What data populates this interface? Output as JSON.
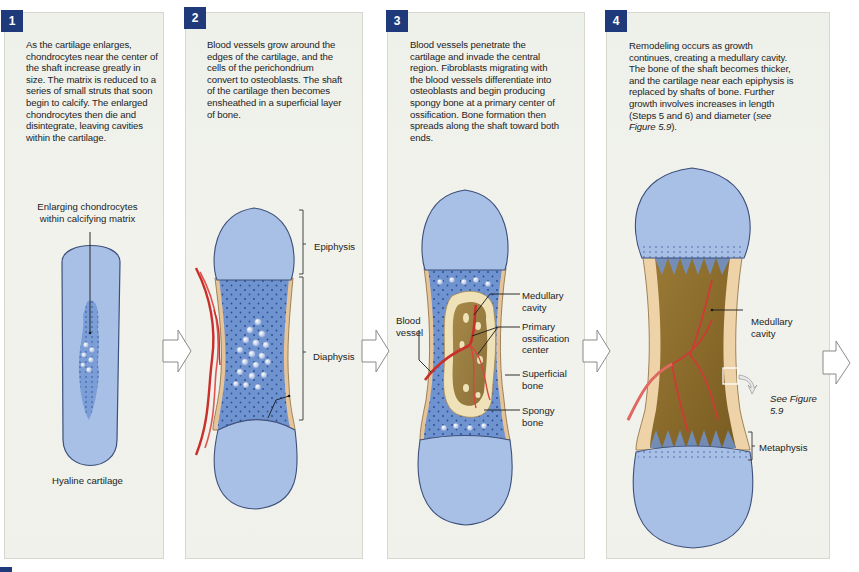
{
  "figure": {
    "steps": [
      {
        "number": "1",
        "text": "As the cartilage enlarges, chondrocytes near the center of the shaft increase greatly in size. The matrix is reduced to a series of small struts that soon begin to calcify. The enlarged chondrocytes then die and disintegrate, leaving cavities within the cartilage.",
        "labels": {
          "enlarging": "Enlarging chondrocytes within calcifying matrix",
          "hyaline": "Hyaline cartilage"
        }
      },
      {
        "number": "2",
        "text": "Blood vessels grow around the edges of the cartilage, and the cells of the perichondrium convert to osteoblasts. The shaft of the cartilage then becomes ensheathed in a superficial layer of bone.",
        "labels": {
          "epiphysis": "Epiphysis",
          "diaphysis": "Diaphysis",
          "bone_formation": "Bone formation"
        }
      },
      {
        "number": "3",
        "text": "Blood vessels penetrate the cartilage and invade the central region. Fibroblasts migrating with the blood vessels differentiate into osteoblasts and begin producing spongy bone at a primary center of ossification. Bone formation then spreads along the shaft toward both ends.",
        "labels": {
          "blood_vessel": "Blood vessel",
          "medullary_cavity": "Medullary cavity",
          "primary_ossification": "Primary ossification center",
          "superficial_bone": "Superficial bone",
          "spongy_bone": "Spongy bone"
        }
      },
      {
        "number": "4",
        "text_main": "Remodeling occurs as growth continues, creating a medullary cavity. The bone of the shaft becomes thicker, and the cartilage near each epiphysis is replaced by shafts of bone. Further growth involves increases in length (Steps 5 and 6) and diameter (",
        "text_italic_see": "see Figure 5.9",
        "text_end": ").",
        "labels": {
          "medullary_cavity": "Medullary cavity",
          "see_figure": "See Figure 5.9",
          "metaphysis": "Metaphysis"
        }
      }
    ],
    "colors": {
      "badge": "#1f3a7a",
      "cartilage": "#a9c0e6",
      "cartilage_dark": "#6f93cf",
      "bone": "#e8c9a0",
      "spongy": "#8c6a2a",
      "vessel": "#d23a36",
      "panel_bg": "#eff1ea"
    }
  }
}
